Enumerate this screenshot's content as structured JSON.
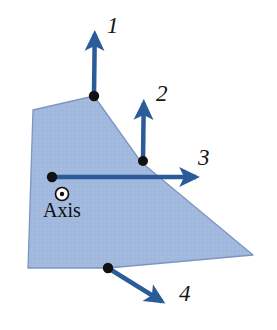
{
  "figure": {
    "background_color": "#ffffff",
    "width": 277,
    "height": 330
  },
  "colors": {
    "body_fill": "#9fb7dd",
    "body_fill_light": "#b3c6e6",
    "body_edge": "#7a93bd",
    "arrow": "#2a5c9a",
    "arrow_dark": "#1f4a80",
    "dot": "#111111",
    "text": "#141414"
  },
  "body": {
    "name": "rigid-plate",
    "vertices": [
      {
        "x": 33,
        "y": 110
      },
      {
        "x": 94,
        "y": 96
      },
      {
        "x": 141,
        "y": 162
      },
      {
        "x": 253,
        "y": 255
      },
      {
        "x": 108,
        "y": 268
      },
      {
        "x": 28,
        "y": 268
      }
    ]
  },
  "axis": {
    "label": "Axis",
    "symbol": "axis-out-of-page",
    "center": {
      "x": 62,
      "y": 194
    },
    "outer_radius": 6.5,
    "inner_radius": 2.2,
    "label_position": {
      "x": 62,
      "y": 217
    }
  },
  "forces": [
    {
      "id": "force-1",
      "label": "1",
      "direction": "up",
      "application_point": {
        "x": 94,
        "y": 96
      },
      "tip": {
        "x": 95,
        "y": 14
      },
      "label_position": {
        "x": 107,
        "y": 33
      },
      "shaft_width": 4.5
    },
    {
      "id": "force-2",
      "label": "2",
      "direction": "up",
      "application_point": {
        "x": 143,
        "y": 161
      },
      "tip": {
        "x": 144,
        "y": 83
      },
      "label_position": {
        "x": 156,
        "y": 101
      },
      "shaft_width": 4.5
    },
    {
      "id": "force-3",
      "label": "3",
      "direction": "right",
      "application_point": {
        "x": 52,
        "y": 177
      },
      "tip": {
        "x": 216,
        "y": 177
      },
      "label_position": {
        "x": 198,
        "y": 165
      },
      "shaft_width": 4.5
    },
    {
      "id": "force-4",
      "label": "4",
      "direction": "down-right",
      "application_point": {
        "x": 108,
        "y": 268
      },
      "tip": {
        "x": 179,
        "y": 312
      },
      "label_position": {
        "x": 179,
        "y": 301
      },
      "shaft_width": 4.5
    }
  ]
}
